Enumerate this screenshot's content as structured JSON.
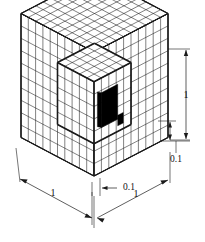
{
  "figure": {
    "type": "isometric-cube-diagram",
    "outer_cube": {
      "grid_divisions": 10,
      "edge_length_label": "1"
    },
    "inner_cube": {
      "grid_divisions": 5,
      "edge_length_label": "0.1"
    },
    "black_cell": {
      "fill_color": "#000000",
      "label": ""
    },
    "line_color": "#1a1a1a",
    "background_color": "#ffffff"
  },
  "dimensions": {
    "bottom_left": {
      "label": "1",
      "name": "bottom-left-dimension"
    },
    "bottom_right": {
      "label": "1",
      "name": "bottom-right-dimension"
    },
    "bottom_center": {
      "label": "0.1",
      "name": "bottom-center-dimension"
    },
    "right_vertical": {
      "label": "1",
      "name": "right-vertical-dimension"
    },
    "right_vertical_small": {
      "label": "0.1",
      "name": "right-vertical-small-dimension"
    }
  }
}
